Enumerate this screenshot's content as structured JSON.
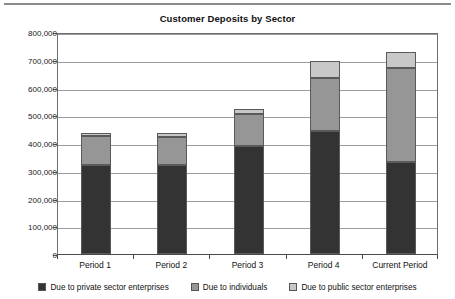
{
  "chart_data": {
    "type": "bar",
    "subtype": "stacked-vertical",
    "title": "Customer Deposits by Sector",
    "xlabel": "",
    "ylabel": "",
    "ylim": [
      0,
      800000
    ],
    "grid": true,
    "legend_position": "bottom",
    "categories": [
      "Period 1",
      "Period 2",
      "Period 3",
      "Period 4",
      "Current Period"
    ],
    "ytick_labels": [
      "800,000",
      "700,000",
      "600,000",
      "500,000",
      "400,000",
      "300,000",
      "200,000",
      "100,000",
      "0"
    ],
    "ytick_values": [
      800000,
      700000,
      600000,
      500000,
      400000,
      300000,
      200000,
      100000,
      0
    ],
    "series": [
      {
        "name": "Due to private sector enterprises",
        "color": "#333333",
        "values": [
          322000,
          321000,
          390000,
          445000,
          332000
        ]
      },
      {
        "name": "Due to individuals",
        "color": "#969696",
        "values": [
          103000,
          102000,
          115000,
          190000,
          340000
        ]
      },
      {
        "name": "Due to public sector enterprises",
        "color": "#c8c8c8",
        "values": [
          12000,
          13000,
          17000,
          60000,
          56000
        ]
      }
    ],
    "totals": [
      437000,
      436000,
      522000,
      695000,
      728000
    ]
  },
  "colors": {
    "private_sector": "#333333",
    "individuals": "#969696",
    "public_sector": "#c8c8c8",
    "gridline": "#9b9b9b",
    "axis": "#4a4a4a",
    "top_rule": "#8a8a8a"
  }
}
